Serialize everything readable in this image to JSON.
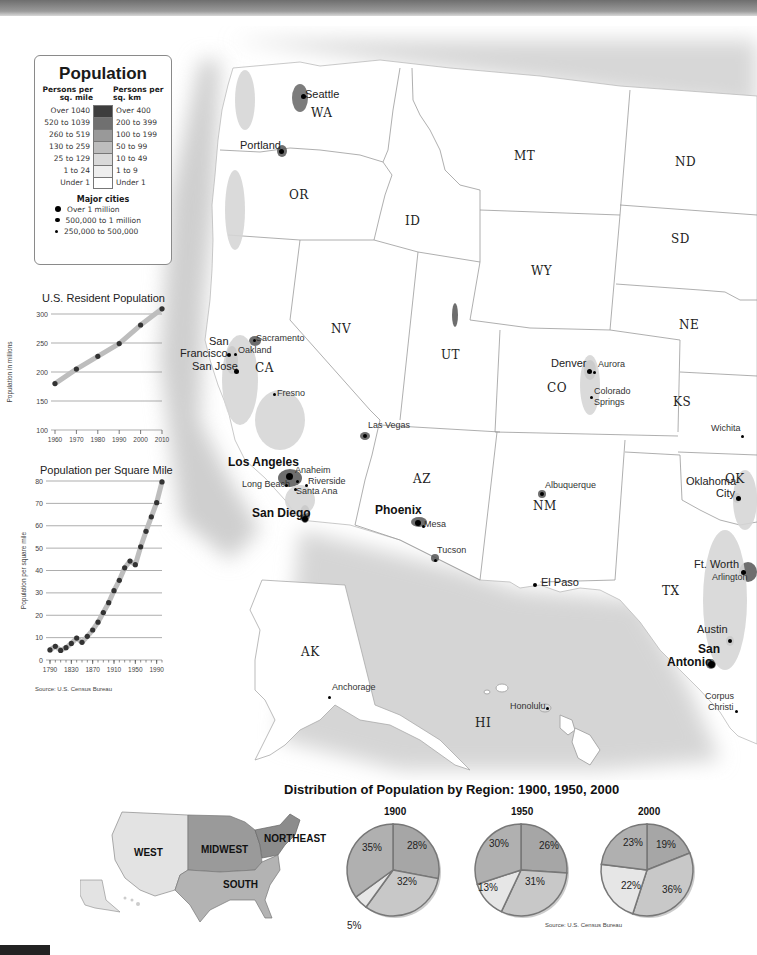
{
  "legend": {
    "title": "Population",
    "col_left": "Persons per sq. mile",
    "col_right": "Persons per sq. km",
    "rows": [
      {
        "mile": "Over 1040",
        "km": "Over 400",
        "color": "#3d3d3d"
      },
      {
        "mile": "520 to 1039",
        "km": "200 to 399",
        "color": "#707070"
      },
      {
        "mile": "260 to 519",
        "km": "100 to 199",
        "color": "#999999"
      },
      {
        "mile": "130 to 259",
        "km": "50 to 99",
        "color": "#bdbdbd"
      },
      {
        "mile": "25 to 129",
        "km": "10 to 49",
        "color": "#d9d9d9"
      },
      {
        "mile": "1 to 24",
        "km": "1 to 9",
        "color": "#eeeeee"
      },
      {
        "mile": "Under 1",
        "km": "Under 1",
        "color": "#ffffff"
      }
    ],
    "cities_title": "Major cities",
    "city_sizes": [
      {
        "label": "Over 1 million",
        "size": 6
      },
      {
        "label": "500,000 to 1 million",
        "size": 4.5
      },
      {
        "label": "250,000 to 500,000",
        "size": 3
      }
    ]
  },
  "map": {
    "states": [
      {
        "abbr": "WA",
        "x": 321,
        "y": 114
      },
      {
        "abbr": "OR",
        "x": 299,
        "y": 196
      },
      {
        "abbr": "ID",
        "x": 415,
        "y": 222
      },
      {
        "abbr": "MT",
        "x": 524,
        "y": 157
      },
      {
        "abbr": "ND",
        "x": 685,
        "y": 163
      },
      {
        "abbr": "SD",
        "x": 681,
        "y": 240
      },
      {
        "abbr": "WY",
        "x": 541,
        "y": 272
      },
      {
        "abbr": "NE",
        "x": 689,
        "y": 326
      },
      {
        "abbr": "NV",
        "x": 341,
        "y": 330
      },
      {
        "abbr": "UT",
        "x": 451,
        "y": 356
      },
      {
        "abbr": "CA",
        "x": 265,
        "y": 369
      },
      {
        "abbr": "CO",
        "x": 557,
        "y": 389
      },
      {
        "abbr": "KS",
        "x": 683,
        "y": 403
      },
      {
        "abbr": "AZ",
        "x": 423,
        "y": 480
      },
      {
        "abbr": "NM",
        "x": 543,
        "y": 507
      },
      {
        "abbr": "OK",
        "x": 735,
        "y": 480
      },
      {
        "abbr": "TX",
        "x": 672,
        "y": 592
      },
      {
        "abbr": "AK",
        "x": 311,
        "y": 653
      },
      {
        "abbr": "HI",
        "x": 485,
        "y": 724
      }
    ],
    "cities": [
      {
        "name": "Seattle",
        "x": 305,
        "y": 95,
        "size": "mid",
        "dot": [
          303,
          96,
          5
        ]
      },
      {
        "name": "Portland",
        "x": 240,
        "y": 146,
        "size": "mid",
        "dot": [
          281,
          151,
          5
        ]
      },
      {
        "name": "Sacramento",
        "x": 256,
        "y": 340,
        "size": "small",
        "dot": [
          254,
          340,
          3
        ]
      },
      {
        "name": "San",
        "x": 209,
        "y": 342,
        "size": "mid",
        "dot": null
      },
      {
        "name": "Francisco",
        "x": 180,
        "y": 354,
        "size": "mid",
        "dot": [
          229,
          355,
          4
        ]
      },
      {
        "name": "Oakland",
        "x": 238,
        "y": 352,
        "size": "small",
        "dot": [
          235,
          354,
          3
        ]
      },
      {
        "name": "San Jose",
        "x": 192,
        "y": 367,
        "size": "mid",
        "dot": [
          236,
          371,
          5
        ]
      },
      {
        "name": "Fresno",
        "x": 277,
        "y": 395,
        "size": "small",
        "dot": [
          274,
          394,
          3
        ]
      },
      {
        "name": "Las Vegas",
        "x": 368,
        "y": 427,
        "size": "small",
        "dot": [
          365,
          436,
          4
        ]
      },
      {
        "name": "Denver",
        "x": 551,
        "y": 364,
        "size": "mid",
        "dot": [
          589,
          371,
          5
        ]
      },
      {
        "name": "Aurora",
        "x": 598,
        "y": 366,
        "size": "small",
        "dot": [
          594,
          372,
          3
        ]
      },
      {
        "name": "Colorado",
        "x": 594,
        "y": 393,
        "size": "small",
        "dot": [
          591,
          397,
          3
        ]
      },
      {
        "name": "Springs",
        "x": 594,
        "y": 404,
        "size": "small",
        "dot": null
      },
      {
        "name": "Wichita",
        "x": 711,
        "y": 430,
        "size": "small",
        "dot": [
          742,
          436,
          3
        ]
      },
      {
        "name": "Los Angeles",
        "x": 228,
        "y": 462,
        "size": "big",
        "dot": [
          289,
          476,
          7
        ]
      },
      {
        "name": "Anaheim",
        "x": 295,
        "y": 472,
        "size": "small",
        "dot": [
          297,
          481,
          3
        ]
      },
      {
        "name": "Long Beach",
        "x": 242,
        "y": 486,
        "size": "small",
        "dot": [
          286,
          485,
          3
        ]
      },
      {
        "name": "Riverside",
        "x": 308,
        "y": 483,
        "size": "small",
        "dot": [
          306,
          485,
          3
        ]
      },
      {
        "name": "Santa Ana",
        "x": 296,
        "y": 493,
        "size": "small",
        "dot": [
          295,
          489,
          3
        ]
      },
      {
        "name": "San Diego",
        "x": 252,
        "y": 513,
        "size": "big",
        "dot": [
          305,
          519,
          6
        ]
      },
      {
        "name": "Phoenix",
        "x": 375,
        "y": 510,
        "size": "big",
        "dot": [
          418,
          523,
          6
        ]
      },
      {
        "name": "Mesa",
        "x": 424,
        "y": 526,
        "size": "small",
        "dot": [
          423,
          526,
          3
        ]
      },
      {
        "name": "Tucson",
        "x": 437,
        "y": 552,
        "size": "small",
        "dot": [
          435,
          560,
          3
        ]
      },
      {
        "name": "Albuquerque",
        "x": 545,
        "y": 487,
        "size": "small",
        "dot": [
          542,
          494,
          4
        ]
      },
      {
        "name": "El Paso",
        "x": 541,
        "y": 583,
        "size": "mid",
        "dot": [
          535,
          585,
          4
        ]
      },
      {
        "name": "Oklahoma",
        "x": 686,
        "y": 482,
        "size": "mid",
        "dot": null
      },
      {
        "name": "City",
        "x": 716,
        "y": 494,
        "size": "mid",
        "dot": [
          738,
          498,
          5
        ]
      },
      {
        "name": "Ft. Worth",
        "x": 694,
        "y": 565,
        "size": "mid",
        "dot": [
          743,
          572,
          5
        ]
      },
      {
        "name": "Arlington",
        "x": 712,
        "y": 579,
        "size": "small",
        "dot": null
      },
      {
        "name": "Austin",
        "x": 697,
        "y": 630,
        "size": "mid",
        "dot": [
          730,
          641,
          4
        ]
      },
      {
        "name": "San",
        "x": 698,
        "y": 649,
        "size": "big",
        "dot": null
      },
      {
        "name": "Antonio",
        "x": 667,
        "y": 662,
        "size": "big",
        "dot": [
          711,
          664,
          7
        ]
      },
      {
        "name": "Corpus",
        "x": 705,
        "y": 698,
        "size": "small",
        "dot": null
      },
      {
        "name": "Christi",
        "x": 708,
        "y": 709,
        "size": "small",
        "dot": [
          736,
          711,
          3
        ]
      },
      {
        "name": "Anchorage",
        "x": 332,
        "y": 689,
        "size": "small",
        "dot": [
          329,
          697,
          3
        ]
      },
      {
        "name": "Honolulu",
        "x": 510,
        "y": 708,
        "size": "small",
        "dot": [
          547,
          708,
          3
        ]
      }
    ]
  },
  "resident_chart": {
    "title": "U.S. Resident Population",
    "ylabel": "Population in millions",
    "source": ""
  },
  "density_chart": {
    "title": "Population per Square Mile",
    "ylabel": "Population per square mile",
    "source": "Source: U.S. Census Bureau"
  },
  "distribution": {
    "title": "Distribution of Population by Region: 1900, 1950, 2000",
    "regions": [
      "WEST",
      "MIDWEST",
      "NORTHEAST",
      "SOUTH"
    ],
    "source": "Source: U.S. Census Bureau"
  },
  "chart_data": [
    {
      "type": "line",
      "title": "U.S. Resident Population",
      "xlabel": "",
      "ylabel": "Population in millions",
      "x": [
        1960,
        1970,
        1980,
        1990,
        2000,
        2010
      ],
      "series": [
        {
          "name": "Population",
          "values": [
            180,
            205,
            227,
            249,
            281,
            309
          ]
        }
      ],
      "xticks": [
        "1960",
        "1970",
        "1980",
        "1990",
        "2000",
        "2010"
      ],
      "yticks": [
        100,
        150,
        200,
        250,
        300
      ],
      "ylim": [
        100,
        300
      ],
      "grid": true
    },
    {
      "type": "line",
      "title": "Population per Square Mile",
      "xlabel": "",
      "ylabel": "Population per square mile",
      "x": [
        1790,
        1800,
        1810,
        1820,
        1830,
        1840,
        1850,
        1860,
        1870,
        1880,
        1890,
        1900,
        1910,
        1920,
        1930,
        1940,
        1950,
        1960,
        1970,
        1980,
        1990,
        2000
      ],
      "series": [
        {
          "name": "Density",
          "values": [
            4.5,
            6.1,
            4.3,
            5.5,
            7.4,
            9.8,
            7.9,
            10.6,
            13.4,
            16.9,
            21.2,
            25.6,
            31.0,
            35.6,
            41.2,
            44.2,
            42.6,
            50.6,
            57.5,
            64.0,
            70.3,
            79.6
          ]
        }
      ],
      "xticks": [
        "1790",
        "1830",
        "1870",
        "1910",
        "1950",
        "1990"
      ],
      "yticks": [
        0,
        10,
        20,
        30,
        40,
        50,
        60,
        70,
        80
      ],
      "ylim": [
        0,
        80
      ],
      "grid": true,
      "source": "Source: U.S. Census Bureau"
    },
    {
      "type": "pie",
      "title": "1900",
      "categories": [
        "Northeast",
        "South",
        "Midwest (low)",
        "West",
        "Midwest"
      ],
      "slices": [
        {
          "label": "Northeast",
          "value": 28
        },
        {
          "label": "South",
          "value": 32
        },
        {
          "label": "West",
          "value": 5
        },
        {
          "label": "Midwest",
          "value": 35
        }
      ]
    },
    {
      "type": "pie",
      "title": "1950",
      "slices": [
        {
          "label": "Northeast",
          "value": 26
        },
        {
          "label": "South",
          "value": 31
        },
        {
          "label": "West",
          "value": 13
        },
        {
          "label": "Midwest",
          "value": 30
        }
      ]
    },
    {
      "type": "pie",
      "title": "2000",
      "slices": [
        {
          "label": "Northeast",
          "value": 19
        },
        {
          "label": "South",
          "value": 36
        },
        {
          "label": "West",
          "value": 22
        },
        {
          "label": "Midwest",
          "value": 23
        }
      ]
    }
  ]
}
